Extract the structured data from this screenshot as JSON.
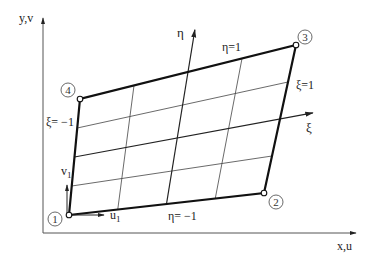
{
  "diagram": {
    "axes": {
      "x_label": "x,u",
      "y_label": "y,v",
      "xi_label": "ξ",
      "eta_label": "η"
    },
    "edge_labels": {
      "eta_top": "η=1",
      "eta_bottom": "η= −1",
      "xi_right": "ξ=1",
      "xi_left": "ξ= −1"
    },
    "dof_labels": {
      "u1": "u",
      "u1_sub": "1",
      "v1": "v",
      "v1_sub": "1"
    },
    "nodes": [
      {
        "id": "1",
        "x": 69,
        "y": 215
      },
      {
        "id": "2",
        "x": 264,
        "y": 193
      },
      {
        "id": "3",
        "x": 296,
        "y": 45
      },
      {
        "id": "4",
        "x": 80,
        "y": 99
      }
    ],
    "colors": {
      "ink": "#222222",
      "thin_line": "#444444",
      "axis": "#555555"
    }
  }
}
